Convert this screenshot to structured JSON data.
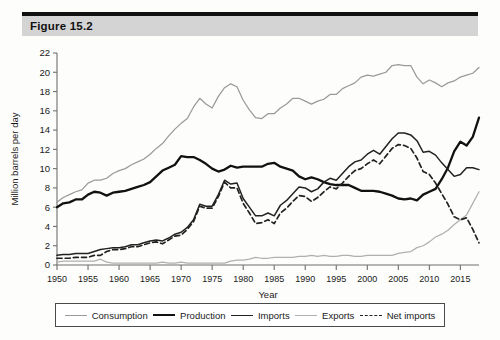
{
  "figure": {
    "title": "Figure 15.2"
  },
  "legend": {
    "items": [
      {
        "label": "Consumption",
        "key": "consumption"
      },
      {
        "label": "Production",
        "key": "production"
      },
      {
        "label": "Imports",
        "key": "imports"
      },
      {
        "label": "Exports",
        "key": "exports"
      },
      {
        "label": "Net imports",
        "key": "net_imports"
      }
    ]
  },
  "colors": {
    "consumption": "#9a9a9a",
    "production": "#111111",
    "imports": "#222222",
    "exports": "#b0b0b0",
    "net_imports": "#222222",
    "axis": "#6f6f6f",
    "header_band": "#d4d4d4",
    "header_rule": "#111111"
  },
  "chart_data": {
    "type": "line",
    "title": "Figure 15.2",
    "xlabel": "Year",
    "ylabel": "Million barrels per day",
    "xlim": [
      1950,
      2018
    ],
    "ylim": [
      0,
      22
    ],
    "yticks": [
      0,
      2,
      4,
      6,
      8,
      10,
      12,
      14,
      16,
      18,
      20,
      22
    ],
    "xticks": [
      1950,
      1955,
      1960,
      1965,
      1970,
      1975,
      1980,
      1985,
      1990,
      1995,
      2000,
      2005,
      2010,
      2015
    ],
    "grid": false,
    "legend_position": "bottom",
    "x": [
      1950,
      1951,
      1952,
      1953,
      1954,
      1955,
      1956,
      1957,
      1958,
      1959,
      1960,
      1961,
      1962,
      1963,
      1964,
      1965,
      1966,
      1967,
      1968,
      1969,
      1970,
      1971,
      1972,
      1973,
      1974,
      1975,
      1976,
      1977,
      1978,
      1979,
      1980,
      1981,
      1982,
      1983,
      1984,
      1985,
      1986,
      1987,
      1988,
      1989,
      1990,
      1991,
      1992,
      1993,
      1994,
      1995,
      1996,
      1997,
      1998,
      1999,
      2000,
      2001,
      2002,
      2003,
      2004,
      2005,
      2006,
      2007,
      2008,
      2009,
      2010,
      2011,
      2012,
      2013,
      2014,
      2015,
      2016,
      2017,
      2018
    ],
    "series": [
      {
        "name": "Consumption",
        "style": "solid-light",
        "values": [
          6.5,
          7.0,
          7.3,
          7.6,
          7.8,
          8.5,
          8.8,
          8.8,
          9.0,
          9.5,
          9.8,
          10.0,
          10.4,
          10.7,
          11.0,
          11.5,
          12.1,
          12.6,
          13.4,
          14.1,
          14.7,
          15.2,
          16.4,
          17.3,
          16.7,
          16.3,
          17.5,
          18.4,
          18.8,
          18.5,
          17.1,
          16.1,
          15.3,
          15.2,
          15.7,
          15.7,
          16.3,
          16.7,
          17.3,
          17.3,
          17.0,
          16.7,
          17.0,
          17.2,
          17.7,
          17.7,
          18.3,
          18.6,
          18.9,
          19.5,
          19.7,
          19.6,
          19.8,
          20.0,
          20.7,
          20.8,
          20.7,
          20.7,
          19.5,
          18.8,
          19.2,
          18.9,
          18.5,
          18.9,
          19.1,
          19.5,
          19.7,
          19.9,
          20.5
        ]
      },
      {
        "name": "Production",
        "style": "solid-thick",
        "values": [
          6.0,
          6.4,
          6.5,
          6.8,
          6.8,
          7.3,
          7.6,
          7.5,
          7.2,
          7.5,
          7.6,
          7.7,
          7.9,
          8.1,
          8.3,
          8.6,
          9.2,
          9.8,
          10.1,
          10.4,
          11.3,
          11.2,
          11.2,
          10.9,
          10.5,
          10.0,
          9.7,
          9.9,
          10.3,
          10.1,
          10.2,
          10.2,
          10.2,
          10.2,
          10.5,
          10.6,
          10.2,
          10.0,
          9.8,
          9.2,
          8.9,
          9.1,
          8.9,
          8.6,
          8.4,
          8.3,
          8.3,
          8.3,
          8.0,
          7.7,
          7.7,
          7.7,
          7.6,
          7.4,
          7.2,
          6.9,
          6.8,
          6.9,
          6.7,
          7.3,
          7.6,
          7.9,
          8.9,
          10.1,
          11.8,
          12.8,
          12.4,
          13.3,
          15.3
        ]
      },
      {
        "name": "Imports",
        "style": "solid-medium",
        "values": [
          1.0,
          1.1,
          1.1,
          1.2,
          1.2,
          1.2,
          1.4,
          1.6,
          1.7,
          1.8,
          1.8,
          1.9,
          2.1,
          2.1,
          2.3,
          2.5,
          2.6,
          2.5,
          2.8,
          3.2,
          3.4,
          3.9,
          4.7,
          6.3,
          6.1,
          6.1,
          7.3,
          8.8,
          8.4,
          8.5,
          6.9,
          6.0,
          5.1,
          5.1,
          5.4,
          5.1,
          6.2,
          6.7,
          7.4,
          8.1,
          8.0,
          7.6,
          7.9,
          8.6,
          9.0,
          8.8,
          9.5,
          10.2,
          10.7,
          10.9,
          11.5,
          11.9,
          11.5,
          12.3,
          13.1,
          13.7,
          13.7,
          13.5,
          12.9,
          11.7,
          11.8,
          11.4,
          10.6,
          9.9,
          9.2,
          9.4,
          10.1,
          10.1,
          9.9
        ]
      },
      {
        "name": "Exports",
        "style": "solid-light",
        "values": [
          0.3,
          0.4,
          0.4,
          0.4,
          0.4,
          0.4,
          0.4,
          0.6,
          0.3,
          0.2,
          0.2,
          0.2,
          0.2,
          0.2,
          0.2,
          0.2,
          0.2,
          0.3,
          0.2,
          0.2,
          0.3,
          0.2,
          0.2,
          0.2,
          0.2,
          0.2,
          0.2,
          0.2,
          0.4,
          0.5,
          0.5,
          0.6,
          0.8,
          0.7,
          0.7,
          0.8,
          0.8,
          0.8,
          0.8,
          0.9,
          0.9,
          1.0,
          0.9,
          1.0,
          0.9,
          0.9,
          1.0,
          1.0,
          0.9,
          0.9,
          1.0,
          1.0,
          1.0,
          1.0,
          1.0,
          1.2,
          1.3,
          1.4,
          1.8,
          2.0,
          2.4,
          2.9,
          3.2,
          3.6,
          4.2,
          4.7,
          5.2,
          6.4,
          7.6
        ]
      },
      {
        "name": "Net imports",
        "style": "dashed",
        "values": [
          0.7,
          0.7,
          0.7,
          0.8,
          0.8,
          0.8,
          1.0,
          1.0,
          1.4,
          1.6,
          1.6,
          1.7,
          1.9,
          1.9,
          2.1,
          2.3,
          2.4,
          2.2,
          2.6,
          3.0,
          3.1,
          3.7,
          4.5,
          6.1,
          5.9,
          5.9,
          7.1,
          8.6,
          8.0,
          8.0,
          6.4,
          5.4,
          4.3,
          4.4,
          4.7,
          4.3,
          5.4,
          5.9,
          6.6,
          7.2,
          7.1,
          6.6,
          7.0,
          7.6,
          8.1,
          7.9,
          8.5,
          9.2,
          9.8,
          10.0,
          10.5,
          10.9,
          10.5,
          11.3,
          12.1,
          12.5,
          12.4,
          12.1,
          11.1,
          9.7,
          9.4,
          8.5,
          7.4,
          6.3,
          5.0,
          4.7,
          4.9,
          3.7,
          2.3
        ]
      }
    ]
  }
}
